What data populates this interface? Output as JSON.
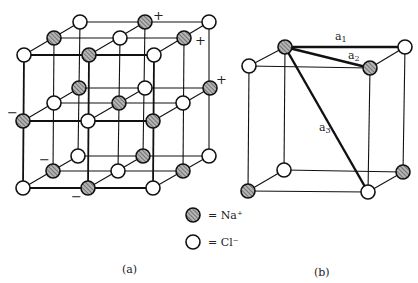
{
  "figure_a": {
    "caption": "(a)",
    "legend": [
      {
        "symbol": "hatched-circle",
        "text": "= Na⁺"
      },
      {
        "symbol": "open-circle",
        "text": "= Cl⁻"
      }
    ],
    "charge_labels": {
      "plus": "+",
      "minus": "−"
    }
  },
  "figure_b": {
    "caption": "(b)",
    "distance_labels": {
      "a1": "a",
      "a1_sub": "1",
      "a2": "a",
      "a2_sub": "2",
      "a3": "a",
      "a3_sub": "3"
    }
  },
  "colors": {
    "line": "#111111",
    "na_fill": "#9a9a9a",
    "cl_fill": "#ffffff"
  }
}
